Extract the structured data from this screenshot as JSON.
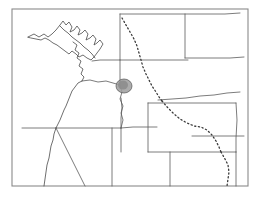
{
  "map": {
    "title": "Western United States state outline map",
    "width": 260,
    "height": 204,
    "background_color": "#ffffff",
    "border_color": "#8a8a8a",
    "coastline_color": "#4a4a4a",
    "state_line_color": "#5a5a5a",
    "dotted_line_color": "#3a3a3a",
    "highlight_fill": "#9e9e9e",
    "highlight_stroke": "#555555",
    "frame": {
      "x": 12,
      "y": 9,
      "width": 236,
      "height": 177
    },
    "regions": [
      {
        "name": "washington",
        "label": "Washington"
      },
      {
        "name": "oregon",
        "label": "Oregon"
      },
      {
        "name": "idaho",
        "label": "Idaho"
      },
      {
        "name": "montana",
        "label": "Montana"
      },
      {
        "name": "wyoming",
        "label": "Wyoming"
      },
      {
        "name": "nevada",
        "label": "Nevada"
      },
      {
        "name": "utah",
        "label": "Utah"
      },
      {
        "name": "colorado",
        "label": "Colorado"
      },
      {
        "name": "north-dakota",
        "label": "North Dakota"
      },
      {
        "name": "south-dakota",
        "label": "South Dakota"
      },
      {
        "name": "nebraska",
        "label": "Nebraska"
      },
      {
        "name": "california",
        "label": "California"
      }
    ],
    "highlight": {
      "name": "study-area-highlight",
      "center_x": 124,
      "center_y": 86,
      "radius_x": 8,
      "radius_y": 7,
      "description": "Shaded study area at the Washington / Oregon / Idaho junction"
    },
    "dotted_features": [
      {
        "name": "idaho-montana-divide",
        "style": "dotted"
      },
      {
        "name": "wyoming-diagonal-route",
        "style": "dotted"
      },
      {
        "name": "southern-route-extension",
        "style": "dotted"
      }
    ],
    "paths": {
      "coastline": "M 28 37 L 36 33 L 43 36 L 48 33 L 52 36 L 57 31 L 60 26 L 63 22 L 66 26 L 69 23 L 72 27 L 70 33 L 74 31 L 77 27 L 80 30 L 78 36 L 82 34 L 86 31 L 89 35 L 87 41 L 91 39 L 95 36 L 98 40 L 96 46 L 99 44 L 102 41 L 104 45 L 101 50 L 98 54 L 95 58 L 92 61 L 88 59 L 84 56 L 80 58 L 77 55 L 73 52 L 70 55 L 66 52 L 62 49 L 58 46 L 54 44 L 50 41 L 46 39 L 42 41 L 38 40 L 33 39 Z",
      "puget_inner": "M 72 41 L 76 44 L 74 49 L 78 52 L 76 57 L 80 60 L 78 65 L 82 68 L 80 73 L 84 76 L 82 81",
      "wa_or_coast_south": "M 78 66 L 75 70 L 72 74 L 70 79 L 68 84 L 66 89 L 64 94 L 62 99 L 60 104 L 58 109 L 56 114 L 55 119 L 54 124 L 53 128",
      "or_ca_coast": "M 53 128 L 52 133 L 51 139 L 50 145 L 49 152 L 48 159 L 47 166 L 46 173 L 45 180 L 44 186",
      "wa_or_border": "M 82 81 L 90 80 L 98 82 L 106 81 L 113 83 L 120 84",
      "or_id_border": "M 120 84 L 121 92 L 120 100 L 122 108 L 121 116 L 122 124 L 121 128",
      "or_ca_border": "M 53 128 L 62 128 L 71 128 L 80 128 L 90 128 L 100 128 L 110 128 L 121 128",
      "id_wa_border": "M 120 84 L 120 72 L 120 60",
      "wa_north_border": "M 92 61 L 100 60 L 108 60 L 116 60 L 124 60 L 132 60 L 140 60 L 148 60 L 156 60",
      "id_panhandle": "M 120 60 L 120 48 L 120 36 L 120 24 L 120 14",
      "id_mt_divide": "M 120 14 L 124 22 L 128 29 L 133 36 L 137 43 L 140 50 L 143 57 L 145 64 L 148 70 L 152 76 L 156 82 L 160 88",
      "mt_north": "M 120 14 L 135 14 L 150 14 L 165 14 L 180 14 L 195 14 L 210 14 L 225 14 L 240 14",
      "mt_nd_border": "M 185 14 L 185 38 L 185 58",
      "mt_wy_border": "M 160 88 L 172 87 L 185 86 L 198 85 L 211 84 L 222 83 L 233 82 L 244 81",
      "nd_sd_border": "M 185 58 L 200 58 L 215 58 L 230 58 L 244 58",
      "sd_ne_border": "M 192 135 L 205 135 L 218 135 L 231 135 L 244 135",
      "wy_box_top": "M 158 102 L 175 102 L 192 102 L 209 102 L 226 102 L 240 102",
      "wy_box_left": "M 158 102 L 158 118 L 158 134 L 158 152",
      "wy_box_bottom": "M 158 152 L 175 152 L 192 152 L 209 152 L 226 152 L 240 152",
      "wy_box_right": "M 240 102 L 240 120 L 240 138 L 240 152",
      "or_nv_border": "M 121 128 L 121 140 L 121 152",
      "nv_ut_border": "M 121 128 L 133 128 L 145 128 L 157 128",
      "nv_ca_border": "M 53 128 L 60 140 L 67 152 L 74 164 L 81 176 L 88 186",
      "ut_co_border": "M 192 128 L 192 145 L 192 162 L 192 186",
      "nv_ut_vert": "M 157 128 L 157 148 L 157 168 L 157 186",
      "ne_border": "M 244 135 L 244 158 L 244 186",
      "dotted_idaho": "M 133 36 L 136 43 L 138 50 L 140 58 L 142 66 L 144 74 L 147 81 L 151 87 L 155 92 L 159 97 L 162 102",
      "dotted_wyoming": "M 162 102 L 168 109 L 174 115 L 180 120 L 187 124 L 194 127 L 201 128 L 208 131 L 213 136 L 217 142 L 220 148 L 222 154",
      "dotted_south": "M 222 154 L 226 160 L 229 166 L 230 173 L 229 180 L 228 186"
    }
  }
}
